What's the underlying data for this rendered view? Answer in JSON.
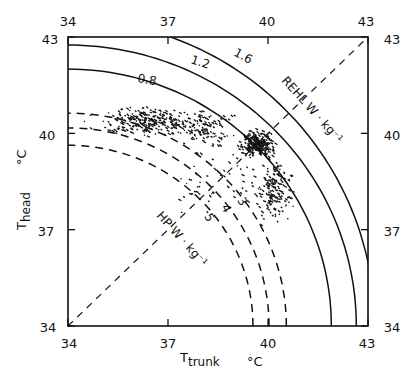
{
  "chart_data": {
    "type": "scatter",
    "title": "",
    "xlabel": "T_trunk",
    "xlabel_main": "T",
    "xlabel_sub": "trunk",
    "xunit": "°C",
    "ylabel": "T_head",
    "ylabel_main": "T",
    "ylabel_sub": "head",
    "yunit": "°C",
    "xlim": [
      34,
      43
    ],
    "ylim": [
      34,
      43
    ],
    "xticks": [
      34,
      37,
      40,
      43
    ],
    "yticks": [
      34,
      37,
      40,
      43
    ],
    "xtick_labels": [
      "34",
      "37",
      "40",
      "43"
    ],
    "ytick_labels": [
      "34",
      "37",
      "40",
      "43"
    ],
    "grid": false,
    "legend": null,
    "diagonal": {
      "from": [
        34,
        34
      ],
      "to": [
        43,
        43
      ],
      "style": "dashed"
    },
    "axis_annotations": {
      "rehl": "REHL  W · kg⁻¹",
      "hp": "HP  W · kg⁻¹"
    },
    "solid_isolines_REHL": [
      {
        "label": "0.8",
        "radius_x_degC": 7.9,
        "radius_y_degC": 8.0
      },
      {
        "label": "1.2",
        "radius_x_degC": 8.65,
        "radius_y_degC": 8.75
      },
      {
        "label": "1.6",
        "radius_x_degC": 9.2,
        "radius_y_degC": 9.55
      }
    ],
    "dashed_isolines_HP": [
      {
        "label": "3",
        "radius_x_degC": 6.55,
        "radius_y_degC": 6.63
      },
      {
        "label": "4",
        "radius_x_degC": 6.03,
        "radius_y_degC": 6.17
      },
      {
        "label": "5",
        "radius_x_degC": 5.55,
        "radius_y_degC": 5.63
      }
    ],
    "scatter_clusters": [
      {
        "name": "upper-left band",
        "center": [
          36.4,
          40.4
        ],
        "spread": [
          1.1,
          0.35
        ],
        "n": 260
      },
      {
        "name": "mid band",
        "center": [
          38.0,
          40.2
        ],
        "spread": [
          0.7,
          0.4
        ],
        "n": 120
      },
      {
        "name": "dense core",
        "center": [
          39.7,
          39.7
        ],
        "spread": [
          0.35,
          0.3
        ],
        "n": 280
      },
      {
        "name": "lower tail",
        "center": [
          40.2,
          38.2
        ],
        "spread": [
          0.45,
          0.7
        ],
        "n": 160
      },
      {
        "name": "sparse outliers",
        "center": [
          38.8,
          38.6
        ],
        "spread": [
          1.3,
          1.0
        ],
        "n": 60
      }
    ]
  }
}
